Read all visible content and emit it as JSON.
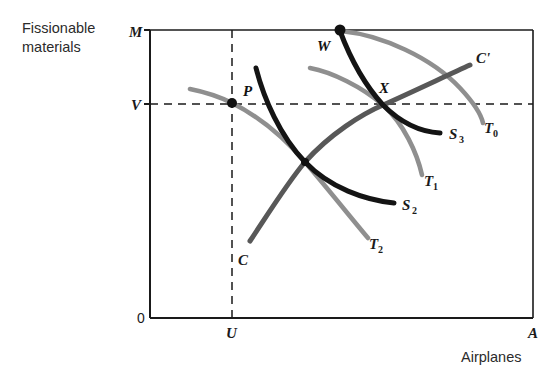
{
  "figure": {
    "type": "economics-indifference-diagram",
    "background": "#ffffff"
  },
  "axes": {
    "y_axis_title_line1": "Fissionable",
    "y_axis_title_line2": "materials",
    "x_axis_title": "Airplanes",
    "y_top_label": "M",
    "y_mid_label": "V",
    "origin_label": "0",
    "x_mid_label": "U",
    "x_end_label": "A",
    "box": {
      "left": 150,
      "top": 30,
      "right": 533,
      "bottom": 318
    },
    "guides": {
      "vertical_dashed_x": 232,
      "horizontal_dashed_y": 104
    }
  },
  "colors": {
    "black_curve": "#141414",
    "gray_curve": "#8f8f8f",
    "dark_gray_line": "#585858",
    "axis": "#1a1a1a",
    "dashed": "#1a1a1a",
    "text": "#1a1a1a"
  },
  "points": [
    {
      "name": "P",
      "label": "P",
      "x": 232,
      "y": 103,
      "label_x": 243,
      "label_y": 95
    },
    {
      "name": "W",
      "label": "W",
      "x": 340,
      "y": 30,
      "label_x": 318,
      "label_y": 49
    },
    {
      "name": "X",
      "label": "X",
      "x": 383,
      "y": 105,
      "label_x": 382,
      "label_y": 92
    },
    {
      "name": "crossing-lower",
      "label": "",
      "x": 305,
      "y": 162,
      "label_x": 0,
      "label_y": 0
    }
  ],
  "curves": [
    {
      "name": "S3",
      "label": "S",
      "subscript": "3",
      "style": "black",
      "label_x": 452,
      "label_y": 139,
      "path": "M 340 31 C 349 55, 362 82, 383 105 C 404 126, 423 132, 440 133"
    },
    {
      "name": "S2",
      "label": "S",
      "subscript": "2",
      "style": "black",
      "label_x": 405,
      "label_y": 210,
      "path": "M 256 68 C 264 99, 280 136, 305 162 C 330 188, 365 200, 394 203"
    },
    {
      "name": "T0",
      "label": "T",
      "subscript": "0",
      "style": "gray",
      "label_x": 487,
      "label_y": 133,
      "path": "M 341 31 C 382 35, 432 58, 460 88 C 474 103, 481 114, 483 123"
    },
    {
      "name": "T1",
      "label": "T",
      "subscript": "1",
      "style": "gray",
      "label_x": 427,
      "label_y": 186,
      "path": "M 310 68 C 332 72, 362 87, 383 105 C 404 124, 417 153, 422 175"
    },
    {
      "name": "T2",
      "label": "T",
      "subscript": "2",
      "style": "gray",
      "label_x": 372,
      "label_y": 249,
      "path": "M 190 89 C 210 93, 222 98, 232 103 C 262 118, 288 142, 305 162 C 328 189, 352 219, 368 238"
    },
    {
      "name": "C-Cprime",
      "label_start": "C",
      "label_end": "C'",
      "style": "dark-gray",
      "label_start_x": 240,
      "label_start_y": 265,
      "label_end_x": 478,
      "label_end_y": 62,
      "path": "M 250 241 C 268 214, 288 182, 305 162 C 330 134, 362 114, 383 105 C 412 92, 450 74, 470 65"
    }
  ]
}
